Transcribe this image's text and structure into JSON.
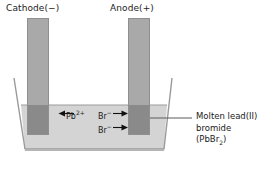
{
  "diagram": {
    "type": "electrolysis-cell"
  },
  "labels": {
    "cathode": "Cathode(−)",
    "anode": "Anode(+)"
  },
  "ions": [
    {
      "name": "lead-ion",
      "symbol": "Pb",
      "charge": "2+",
      "direction": "left",
      "label": "Pb2+"
    },
    {
      "name": "bromide-ion-1",
      "symbol": "Br",
      "charge": "−",
      "direction": "right",
      "label": "Br−"
    },
    {
      "name": "bromide-ion-2",
      "symbol": "Br",
      "charge": "−",
      "direction": "right",
      "label": "Br−"
    }
  ],
  "callout": {
    "line1": "Molten lead(II)",
    "line2": "bromide",
    "formula_prefix": "(PbBr",
    "formula_sub": "2",
    "formula_suffix": ")"
  },
  "colors": {
    "electrode": "#a9a9a9",
    "electrode_submerged": "#8a8a8a",
    "electrode_edge": "#8f8f8f",
    "liquid": "#d4d4d4",
    "beaker_outline": "#9a9a9a",
    "text": "#1b1b1b",
    "background": "#ffffff"
  }
}
